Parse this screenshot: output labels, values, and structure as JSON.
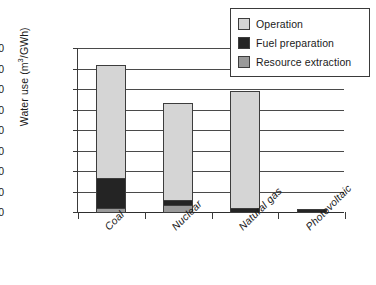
{
  "chart_data": {
    "type": "bar",
    "subtype": "stacked-bar",
    "title": "",
    "xlabel": "",
    "ylabel": "Water use (m3/GWh)",
    "ylabel_parts": {
      "prefix": "Water use (m",
      "superscript": "3",
      "suffix": "/GWh)"
    },
    "categories": [
      "Coal",
      "Nuclear",
      "Natural gas",
      "Photovoltaic"
    ],
    "series": [
      {
        "name": "Resource extraction",
        "color": "#9a9a9a",
        "values": [
          120,
          200,
          0,
          0
        ]
      },
      {
        "name": "Fuel preparation",
        "color": "#242424",
        "values": [
          750,
          150,
          120,
          100
        ]
      },
      {
        "name": "Operation",
        "color": "#d5d5d5",
        "values": [
          2780,
          2380,
          2880,
          0
        ]
      }
    ],
    "totals": [
      3650,
      2730,
      3000,
      100
    ],
    "ylim": [
      0,
      4000
    ],
    "yticks": [
      0,
      500,
      1000,
      1500,
      2000,
      2500,
      3000,
      3500,
      4000
    ],
    "ytick_labels": [
      "0",
      "500",
      "1000",
      "1500",
      "2000",
      "2500",
      "3000",
      "3500",
      "4000"
    ],
    "grid": true,
    "grid_axis": "y",
    "legend_position": "top-right",
    "legend_order": [
      "Operation",
      "Fuel preparation",
      "Resource extraction"
    ],
    "xtick_label_rotation": -45
  },
  "legend": {
    "items": [
      {
        "label": "Operation",
        "color": "#d5d5d5"
      },
      {
        "label": "Fuel preparation",
        "color": "#242424"
      },
      {
        "label": "Resource extraction",
        "color": "#9a9a9a"
      }
    ]
  }
}
